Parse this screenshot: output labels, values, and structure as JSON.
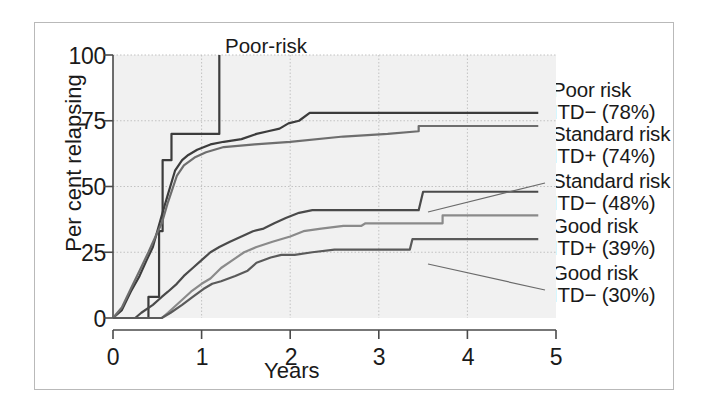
{
  "chart_data": {
    "type": "line",
    "title": "",
    "xlabel": "Years",
    "ylabel": "Per cent relapsing",
    "xlim": [
      0,
      5
    ],
    "ylim": [
      0,
      100
    ],
    "xticks": [
      0,
      1,
      2,
      3,
      4,
      5
    ],
    "xtick_labels": [
      "0",
      "1",
      "2",
      "3",
      "4",
      "5"
    ],
    "yticks": [
      0,
      25,
      50,
      75,
      100
    ],
    "ytick_labels": [
      "0",
      "25",
      "50",
      "75",
      "100"
    ],
    "grid": true,
    "legend_position": "right-outside",
    "annotation_pvalue_italic": "P",
    "annotation_pvalue_rest": " < 0.0001",
    "plot_annotation": {
      "line1": "Poor-risk",
      "line2": "ITD+ (100%)"
    },
    "series": [
      {
        "name": "Poor-risk ITD+",
        "label_line1": "Poor-risk",
        "label_line2": "ITD+ (100%)",
        "final_percent": 100,
        "color": "#3c3c3c",
        "points": [
          [
            0.0,
            0
          ],
          [
            0.4,
            0
          ],
          [
            0.4,
            8
          ],
          [
            0.52,
            8
          ],
          [
            0.52,
            33
          ],
          [
            0.56,
            33
          ],
          [
            0.56,
            60
          ],
          [
            0.66,
            60
          ],
          [
            0.66,
            70
          ],
          [
            0.86,
            70
          ],
          [
            0.86,
            70
          ],
          [
            1.2,
            70
          ],
          [
            1.2,
            100
          ]
        ]
      },
      {
        "name": "Poor risk ITD-",
        "label_line1": "Poor risk",
        "label_line2": "ITD− (78%)",
        "final_percent": 78,
        "color": "#3c3c3c",
        "points": [
          [
            0.0,
            0
          ],
          [
            0.1,
            3
          ],
          [
            0.2,
            10
          ],
          [
            0.3,
            16
          ],
          [
            0.38,
            22
          ],
          [
            0.45,
            27
          ],
          [
            0.5,
            33
          ],
          [
            0.55,
            39
          ],
          [
            0.62,
            47
          ],
          [
            0.7,
            56
          ],
          [
            0.78,
            60
          ],
          [
            0.85,
            62
          ],
          [
            0.95,
            64
          ],
          [
            1.1,
            66
          ],
          [
            1.25,
            67
          ],
          [
            1.45,
            68
          ],
          [
            1.62,
            70
          ],
          [
            1.75,
            71
          ],
          [
            1.88,
            72
          ],
          [
            1.98,
            74
          ],
          [
            2.1,
            75
          ],
          [
            2.22,
            78
          ],
          [
            4.8,
            78
          ]
        ]
      },
      {
        "name": "Standard risk ITD+",
        "label_line1": "Standard risk",
        "label_line2": "ITD+ (74%)",
        "final_percent": 74,
        "color": "#6e6e6e",
        "points": [
          [
            0.0,
            0
          ],
          [
            0.1,
            4
          ],
          [
            0.2,
            11
          ],
          [
            0.3,
            18
          ],
          [
            0.4,
            25
          ],
          [
            0.48,
            31
          ],
          [
            0.55,
            36
          ],
          [
            0.62,
            44
          ],
          [
            0.72,
            54
          ],
          [
            0.8,
            58
          ],
          [
            0.92,
            61
          ],
          [
            1.05,
            63
          ],
          [
            1.25,
            65
          ],
          [
            1.6,
            66
          ],
          [
            2.0,
            67
          ],
          [
            2.6,
            69
          ],
          [
            3.1,
            70
          ],
          [
            3.45,
            71
          ],
          [
            3.45,
            73
          ],
          [
            4.8,
            73
          ]
        ]
      },
      {
        "name": "Standard risk ITD-",
        "label_line1": "Standard risk",
        "label_line2": "ITD− (48%)",
        "final_percent": 48,
        "color": "#4a4a4a",
        "points": [
          [
            0.0,
            0
          ],
          [
            0.25,
            0
          ],
          [
            0.32,
            2
          ],
          [
            0.45,
            5
          ],
          [
            0.55,
            8
          ],
          [
            0.62,
            10
          ],
          [
            0.72,
            13
          ],
          [
            0.8,
            16
          ],
          [
            0.9,
            19
          ],
          [
            1.0,
            22
          ],
          [
            1.1,
            25
          ],
          [
            1.2,
            27
          ],
          [
            1.32,
            29
          ],
          [
            1.45,
            31
          ],
          [
            1.58,
            33
          ],
          [
            1.7,
            34
          ],
          [
            1.82,
            36
          ],
          [
            1.95,
            38
          ],
          [
            2.1,
            40
          ],
          [
            2.25,
            41
          ],
          [
            3.45,
            41
          ],
          [
            3.5,
            48
          ],
          [
            4.8,
            48
          ]
        ]
      },
      {
        "name": "Good risk ITD+",
        "label_line1": "Good risk",
        "label_line2": "ITD+ (39%)",
        "final_percent": 39,
        "color": "#8a8a8a",
        "points": [
          [
            0.0,
            0
          ],
          [
            0.55,
            0
          ],
          [
            0.62,
            2
          ],
          [
            0.75,
            6
          ],
          [
            0.88,
            10
          ],
          [
            1.0,
            13
          ],
          [
            1.1,
            15
          ],
          [
            1.22,
            19
          ],
          [
            1.35,
            22
          ],
          [
            1.48,
            25
          ],
          [
            1.62,
            27
          ],
          [
            1.8,
            29
          ],
          [
            2.0,
            31
          ],
          [
            2.15,
            33
          ],
          [
            2.35,
            34
          ],
          [
            2.6,
            35
          ],
          [
            2.8,
            35
          ],
          [
            2.85,
            36
          ],
          [
            3.1,
            36
          ],
          [
            3.72,
            36
          ],
          [
            3.72,
            39
          ],
          [
            4.8,
            39
          ]
        ]
      },
      {
        "name": "Good risk ITD-",
        "label_line1": "Good risk",
        "label_line2": "ITD− (30%)",
        "final_percent": 30,
        "color": "#5a5a5a",
        "points": [
          [
            0.0,
            0
          ],
          [
            0.55,
            0
          ],
          [
            0.65,
            2
          ],
          [
            0.78,
            5
          ],
          [
            0.9,
            8
          ],
          [
            1.02,
            11
          ],
          [
            1.12,
            13
          ],
          [
            1.22,
            14
          ],
          [
            1.38,
            16
          ],
          [
            1.52,
            18
          ],
          [
            1.62,
            21
          ],
          [
            1.78,
            23
          ],
          [
            1.9,
            24
          ],
          [
            2.05,
            24
          ],
          [
            2.25,
            25
          ],
          [
            2.5,
            26
          ],
          [
            2.8,
            26
          ],
          [
            3.1,
            26
          ],
          [
            3.35,
            26
          ],
          [
            3.38,
            30
          ],
          [
            4.8,
            30
          ]
        ]
      }
    ],
    "legend_entries": [
      {
        "line1": "Poor risk",
        "line2": "ITD− (78%)"
      },
      {
        "line1": "Standard risk",
        "line2": "ITD+ (74%)"
      },
      {
        "line1": "Standard risk",
        "line2": "ITD− (48%)"
      },
      {
        "line1": "Good risk",
        "line2": "ITD+ (39%)"
      },
      {
        "line1": "Good risk",
        "line2": "ITD− (30%)"
      }
    ]
  }
}
